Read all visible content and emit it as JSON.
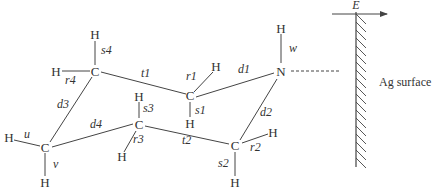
{
  "field": {
    "label": "E",
    "direction": "left"
  },
  "surface": {
    "label": "Ag surface"
  },
  "atoms": {
    "N": "N",
    "H_N": "H",
    "C1": "C",
    "H1a": "H",
    "H1b": "H",
    "C2": "C",
    "H2a": "H",
    "H2b": "H",
    "C3": "C",
    "H3a": "H",
    "H3b": "H",
    "C4": "C",
    "H4a": "H",
    "H4b": "H",
    "C5": "C",
    "H5a": "H",
    "H5b": "H"
  },
  "bond_labels": {
    "w": "w",
    "d1": "d1",
    "d2": "d2",
    "d3": "d3",
    "d4": "d4",
    "t1": "t1",
    "t2": "t2",
    "r1": "r1",
    "r2": "r2",
    "r3": "r3",
    "r4": "r4",
    "s1": "s1",
    "s2": "s2",
    "s3": "s3",
    "s4": "s4",
    "u": "u",
    "v": "v"
  }
}
